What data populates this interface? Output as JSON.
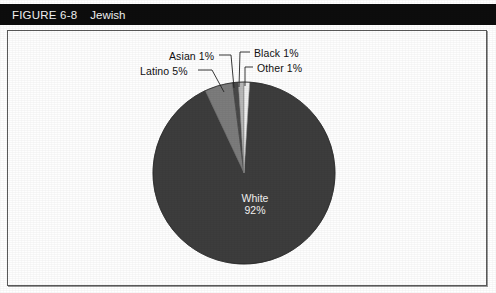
{
  "header": {
    "figure_number": "FIGURE 6-8",
    "title": "Jewish",
    "background_color": "#0d0d0d",
    "text_color": "#f2f2f2"
  },
  "frame": {
    "border_color": "#5a5a5a",
    "background_color": "#fefefe"
  },
  "labels": {
    "asian": "Asian 1%",
    "latino": "Latino 5%",
    "black": "Black 1%",
    "other": "Other 1%",
    "white_name": "White",
    "white_pct": "92%"
  },
  "chart_data": {
    "type": "pie",
    "title": "Jewish",
    "xlabel": "",
    "ylabel": "",
    "legend_position": "callout-labels",
    "grid": false,
    "start_angle_deg": 0,
    "direction": "clockwise",
    "categories": [
      "Other",
      "White",
      "Latino",
      "Asian",
      "Black"
    ],
    "values": [
      1,
      92,
      5,
      1,
      1
    ],
    "slices": [
      {
        "label": "Other",
        "value": 1,
        "display": "Other 1%",
        "color": "#efefef"
      },
      {
        "label": "White",
        "value": 92,
        "display": "White 92%",
        "color": "#3d3d3d"
      },
      {
        "label": "Latino",
        "value": 5,
        "display": "Latino 5%",
        "color": "#7c7c7c"
      },
      {
        "label": "Asian",
        "value": 1,
        "display": "Asian 1%",
        "color": "#494949"
      },
      {
        "label": "Black",
        "value": 1,
        "display": "Black 1%",
        "color": "#b8b8b8"
      }
    ],
    "units": "percent",
    "total": 100
  }
}
